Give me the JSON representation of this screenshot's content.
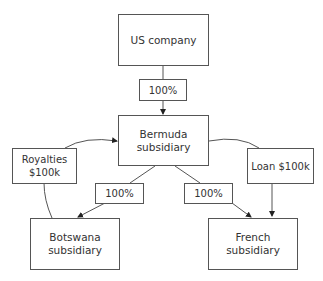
{
  "diagram": {
    "nodes": {
      "us_company": {
        "label": "US company"
      },
      "bermuda": {
        "label_line1": "Bermuda",
        "label_line2": "subsidiary"
      },
      "botswana": {
        "label_line1": "Botswana",
        "label_line2": "subsidiary"
      },
      "french": {
        "label_line1": "French",
        "label_line2": "subsidiary"
      }
    },
    "edge_labels": {
      "us_to_bermuda": "100%",
      "bermuda_to_botswana": "100%",
      "bermuda_to_french": "100%",
      "royalties_line1": "Royalties",
      "royalties_line2": "$100k",
      "loan": "Loan $100k"
    },
    "edges": [
      {
        "from": "US company",
        "to": "Bermuda subsidiary",
        "label": "100%"
      },
      {
        "from": "Bermuda subsidiary",
        "to": "Botswana subsidiary",
        "label": "100%"
      },
      {
        "from": "Bermuda subsidiary",
        "to": "French subsidiary",
        "label": "100%"
      },
      {
        "from": "Botswana subsidiary",
        "to": "Bermuda subsidiary",
        "label": "Royalties $100k"
      },
      {
        "from": "Bermuda subsidiary",
        "to": "French subsidiary",
        "label": "Loan $100k"
      }
    ]
  }
}
